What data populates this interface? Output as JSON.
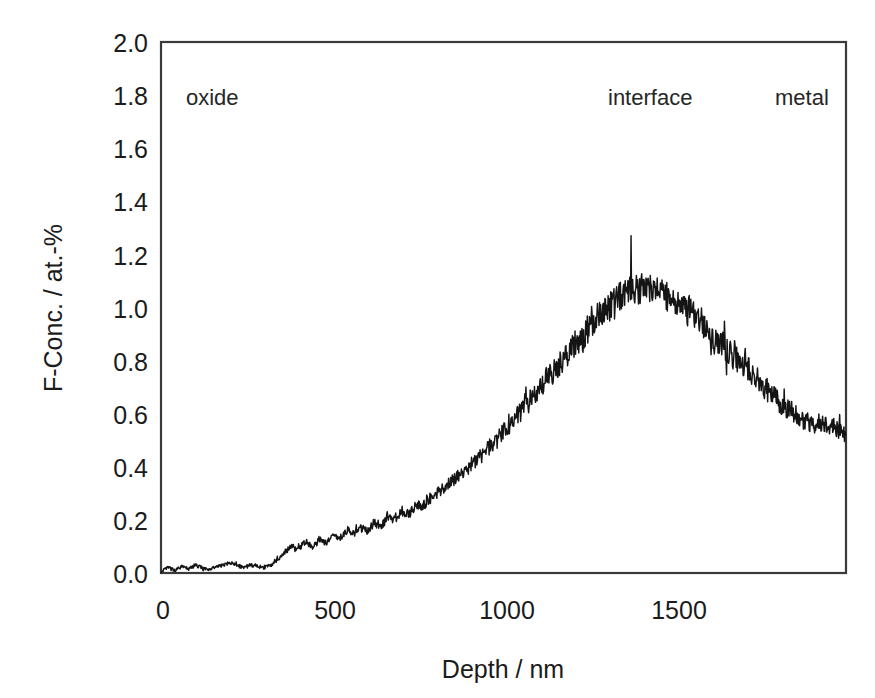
{
  "chart_data": {
    "type": "line",
    "title": "",
    "xlabel": "Depth / nm",
    "ylabel": "F-Conc. / at.-%",
    "xlim": [
      0,
      1990
    ],
    "ylim": [
      0.0,
      2.0
    ],
    "xticks": [
      0,
      500,
      1000,
      1500
    ],
    "xtick_labels": [
      "0",
      "500",
      "1000",
      "1500"
    ],
    "yticks": [
      0.0,
      0.2,
      0.4,
      0.6,
      0.8,
      1.0,
      1.2,
      1.4,
      1.6,
      1.8,
      2.0
    ],
    "ytick_labels": [
      "0.0",
      "0.2",
      "0.4",
      "0.6",
      "0.8",
      "1.0",
      "1.2",
      "1.4",
      "1.6",
      "1.8",
      "2.0"
    ],
    "grid": false,
    "legend": "none",
    "line_color": "#141414",
    "frame_color": "#3a3a3a",
    "annotations": [
      {
        "text": "oxide",
        "x": 70,
        "y": 1.8
      },
      {
        "text": "interface",
        "x": 1300,
        "y": 1.8
      },
      {
        "text": "metal",
        "x": 1790,
        "y": 1.8
      }
    ],
    "series": [
      {
        "name": "F concentration depth profile",
        "x": [
          0,
          20,
          40,
          60,
          80,
          100,
          120,
          140,
          160,
          180,
          200,
          220,
          240,
          260,
          280,
          300,
          320,
          340,
          360,
          380,
          400,
          420,
          440,
          460,
          480,
          500,
          520,
          540,
          560,
          580,
          600,
          620,
          640,
          660,
          680,
          700,
          720,
          740,
          760,
          780,
          800,
          820,
          840,
          860,
          880,
          900,
          920,
          940,
          960,
          980,
          1000,
          1020,
          1040,
          1060,
          1080,
          1100,
          1120,
          1140,
          1160,
          1180,
          1200,
          1220,
          1240,
          1260,
          1280,
          1300,
          1320,
          1340,
          1360,
          1380,
          1400,
          1420,
          1440,
          1460,
          1480,
          1500,
          1520,
          1540,
          1560,
          1580,
          1600,
          1620,
          1640,
          1660,
          1680,
          1700,
          1720,
          1740,
          1760,
          1780,
          1800,
          1820,
          1840,
          1860,
          1880,
          1900,
          1920,
          1940,
          1960,
          1980
        ],
        "y": [
          0.005,
          0.02,
          0.01,
          0.025,
          0.015,
          0.03,
          0.02,
          0.01,
          0.025,
          0.03,
          0.04,
          0.03,
          0.02,
          0.03,
          0.025,
          0.02,
          0.03,
          0.05,
          0.08,
          0.1,
          0.09,
          0.12,
          0.1,
          0.13,
          0.11,
          0.14,
          0.13,
          0.16,
          0.15,
          0.17,
          0.16,
          0.19,
          0.18,
          0.21,
          0.2,
          0.23,
          0.22,
          0.26,
          0.25,
          0.28,
          0.3,
          0.32,
          0.34,
          0.36,
          0.38,
          0.41,
          0.43,
          0.46,
          0.48,
          0.51,
          0.54,
          0.57,
          0.6,
          0.63,
          0.66,
          0.7,
          0.73,
          0.76,
          0.79,
          0.82,
          0.86,
          0.88,
          0.92,
          0.95,
          0.98,
          1.0,
          1.02,
          1.05,
          1.06,
          1.07,
          1.06,
          1.07,
          1.06,
          1.05,
          1.03,
          1.02,
          1.0,
          0.99,
          0.96,
          0.93,
          0.9,
          0.87,
          0.85,
          0.82,
          0.8,
          0.77,
          0.75,
          0.72,
          0.69,
          0.67,
          0.64,
          0.62,
          0.6,
          0.59,
          0.57,
          0.56,
          0.57,
          0.56,
          0.55,
          0.52
        ],
        "noise_amplitude": 0.055,
        "max_spike_value": 1.27,
        "max_spike_x": 1365,
        "end_value": 0.52
      }
    ]
  },
  "plot_geometry": {
    "left": 161,
    "right": 846,
    "top": 42,
    "bottom": 573
  }
}
